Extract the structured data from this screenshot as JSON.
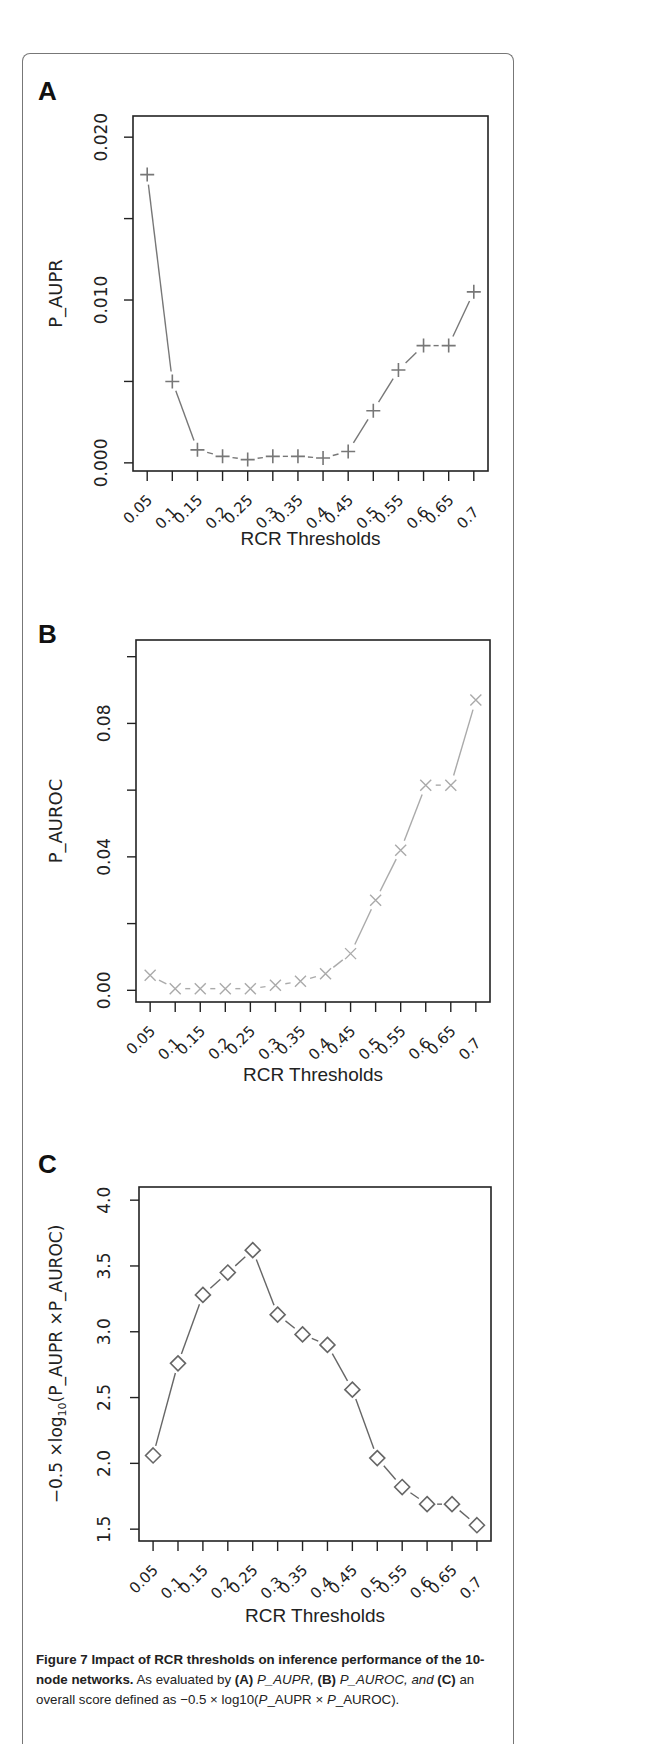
{
  "figure": {
    "caption": {
      "title": "Figure 7 Impact of RCR thresholds on inference performance of the 10-node networks.",
      "body_parts": [
        " As evaluated by ",
        "(A)",
        " P_AUPR, ",
        "(B)",
        " P_AUROC, and ",
        "(C)",
        " an overall score defined as −0.5 × log10(",
        "P",
        "_AUPR × ",
        "P",
        "_AUROC)."
      ]
    }
  },
  "chart_data": [
    {
      "panel": "A",
      "type": "line",
      "marker": "plus",
      "color": "#777777",
      "title": "",
      "xlabel": "RCR Thresholds",
      "ylabel": "P_AUPR",
      "categories": [
        "0.05",
        "0.1",
        "0.15",
        "0.2",
        "0.25",
        "0.3",
        "0.35",
        "0.4",
        "0.45",
        "0.5",
        "0.55",
        "0.6",
        "0.65",
        "0.7"
      ],
      "values": [
        0.0177,
        0.005,
        0.0008,
        0.0004,
        0.0002,
        0.0004,
        0.0004,
        0.0003,
        0.0007,
        0.0032,
        0.0057,
        0.0072,
        0.0072,
        0.0105
      ],
      "yticks": [
        0.0,
        0.005,
        0.01,
        0.015,
        0.02
      ],
      "ytick_labels": [
        "0.000",
        "",
        "0.010",
        "",
        "0.020"
      ],
      "ylim": [
        -0.0005,
        0.0213
      ],
      "grid": false
    },
    {
      "panel": "B",
      "type": "line",
      "marker": "x",
      "color": "#aaaaaa",
      "title": "",
      "xlabel": "RCR Thresholds",
      "ylabel": "P_AUROC",
      "categories": [
        "0.05",
        "0.1",
        "0.15",
        "0.2",
        "0.25",
        "0.3",
        "0.35",
        "0.4",
        "0.45",
        "0.5",
        "0.55",
        "0.6",
        "0.65",
        "0.7"
      ],
      "values": [
        0.0045,
        0.0005,
        0.0005,
        0.0005,
        0.0005,
        0.0015,
        0.0027,
        0.005,
        0.011,
        0.027,
        0.042,
        0.0615,
        0.0615,
        0.087
      ],
      "yticks": [
        0.0,
        0.02,
        0.04,
        0.06,
        0.08,
        0.1
      ],
      "ytick_labels": [
        "0.00",
        "",
        "0.04",
        "",
        "0.08",
        ""
      ],
      "ylim": [
        -0.0035,
        0.105
      ],
      "grid": false
    },
    {
      "panel": "C",
      "type": "line",
      "marker": "diamond",
      "color": "#666666",
      "title": "",
      "xlabel": "RCR Thresholds",
      "ylabel": "−0.5 ×log10(P_AUPR ×P_AUROC)",
      "categories": [
        "0.05",
        "0.1",
        "0.15",
        "0.2",
        "0.25",
        "0.3",
        "0.35",
        "0.4",
        "0.45",
        "0.5",
        "0.55",
        "0.6",
        "0.65",
        "0.7"
      ],
      "values": [
        2.06,
        2.76,
        3.28,
        3.45,
        3.62,
        3.13,
        2.98,
        2.9,
        2.56,
        2.04,
        1.82,
        1.69,
        1.69,
        1.53
      ],
      "yticks": [
        1.5,
        2.0,
        2.5,
        3.0,
        3.5,
        4.0
      ],
      "ytick_labels": [
        "1.5",
        "2.0",
        "2.5",
        "3.0",
        "3.5",
        "4.0"
      ],
      "ylim": [
        1.41,
        4.1
      ],
      "grid": false
    }
  ],
  "panels_layout": [
    {
      "label": "A",
      "label_x": 38,
      "label_y": 100,
      "box": [
        133,
        116,
        488,
        471
      ],
      "ylab_x": 62,
      "tick_label_x": 107,
      "xlabel_y": 545
    },
    {
      "label": "B",
      "label_x": 38,
      "label_y": 643,
      "box": [
        136,
        640,
        490,
        1002
      ],
      "ylab_x": 62,
      "tick_label_x": 110,
      "xlabel_y": 1081
    },
    {
      "label": "C",
      "label_x": 38,
      "label_y": 1173,
      "box": [
        139,
        1187,
        491,
        1541
      ],
      "ylab_x": 62,
      "tick_label_x": 110,
      "xlabel_y": 1622
    }
  ]
}
